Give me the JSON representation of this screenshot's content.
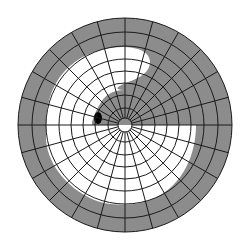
{
  "diagram": {
    "type": "visual-field-perimetry-chart",
    "title": "Visual field chart",
    "center": [
      125,
      125
    ],
    "outer_radius": 107,
    "ring_radii": [
      7,
      17,
      30,
      42,
      54,
      66,
      79,
      93,
      107
    ],
    "spoke_count": 24,
    "spoke_inner_radius": 7,
    "colors": {
      "background": "#ffffff",
      "defect_gray": "#8c8c8c",
      "seeing_white": "#ffffff",
      "grid_line": "#1a1a1a",
      "blind_spot": "#000000"
    },
    "regions": [
      {
        "name": "peripheral-loss-band",
        "fill": "gray",
        "description": "outer band around entire field"
      },
      {
        "name": "upper-right-defect",
        "fill": "gray",
        "description": "wedge in upper-right quadrant extending to center"
      },
      {
        "name": "preserved-field",
        "fill": "white",
        "description": "central and lower/left preserved area"
      }
    ],
    "blind_spot": {
      "cx": 98,
      "cy": 118,
      "rx": 4,
      "ry": 6
    }
  }
}
